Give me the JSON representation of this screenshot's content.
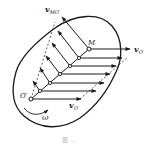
{
  "diagram": {
    "labels": {
      "v_MO": "v",
      "v_MO_sub": "MO′",
      "M": "M",
      "v_O_right": "v",
      "v_O_right_sub": "O′",
      "O": "O′",
      "v_O_bottom": "v",
      "v_O_bottom_sub": "O′",
      "omega": "ω"
    },
    "caption": "图 …",
    "colors": {
      "stroke": "#1a1a1a",
      "background": "#ffffff"
    }
  }
}
